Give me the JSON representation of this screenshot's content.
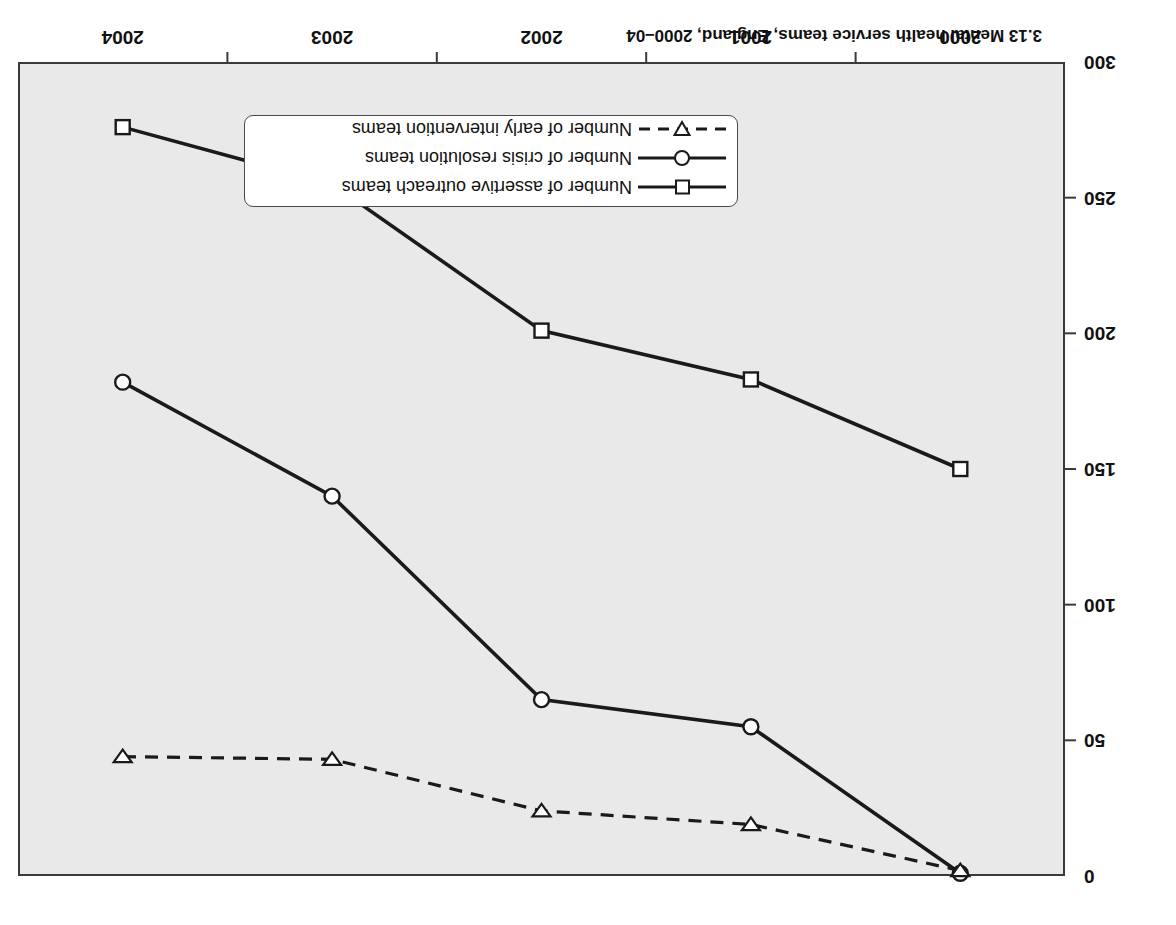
{
  "chart_title": "3.13  Mental health service teams, England, 2000–04",
  "axis_title": "Number of teams",
  "legend": {
    "items": [
      {
        "label": "Number of assertive outreach teams",
        "marker": "square",
        "line": "solid"
      },
      {
        "label": "Number of crisis resolution teams",
        "marker": "circle",
        "line": "solid"
      },
      {
        "label": "Number of early intervention teams",
        "marker": "triangle-down",
        "line": "dashed"
      }
    ]
  },
  "chart_data": {
    "type": "line",
    "title": "3.13  Mental health service teams, England, 2000–04",
    "xlabel": "",
    "ylabel": "Number of teams",
    "x": [
      "2000",
      "2001",
      "2002",
      "2003",
      "2004"
    ],
    "xtick_labels": [
      "2000",
      "2001",
      "2002",
      "2003",
      "2004"
    ],
    "ytick_labels": [
      "0",
      "50",
      "100",
      "150",
      "200",
      "250",
      "300"
    ],
    "yticks": [
      0,
      50,
      100,
      150,
      200,
      250,
      300
    ],
    "ylim": [
      0,
      300
    ],
    "grid": false,
    "legend_position": "lower-centre",
    "series": [
      {
        "name": "Number of assertive outreach teams",
        "marker": "square",
        "line": "solid",
        "values": [
          150,
          183,
          201,
          255,
          276
        ]
      },
      {
        "name": "Number of crisis resolution teams",
        "marker": "circle",
        "line": "solid",
        "values": [
          1,
          55,
          65,
          140,
          182
        ]
      },
      {
        "name": "Number of early intervention teams",
        "marker": "triangle-down",
        "line": "dashed",
        "values": [
          2,
          19,
          24,
          43,
          44
        ]
      }
    ]
  },
  "colors": {
    "plot_background": "#e9e9e9",
    "line": "#1a1a1a",
    "frame": "#3a3a3a",
    "marker_fill": "#ffffff"
  }
}
